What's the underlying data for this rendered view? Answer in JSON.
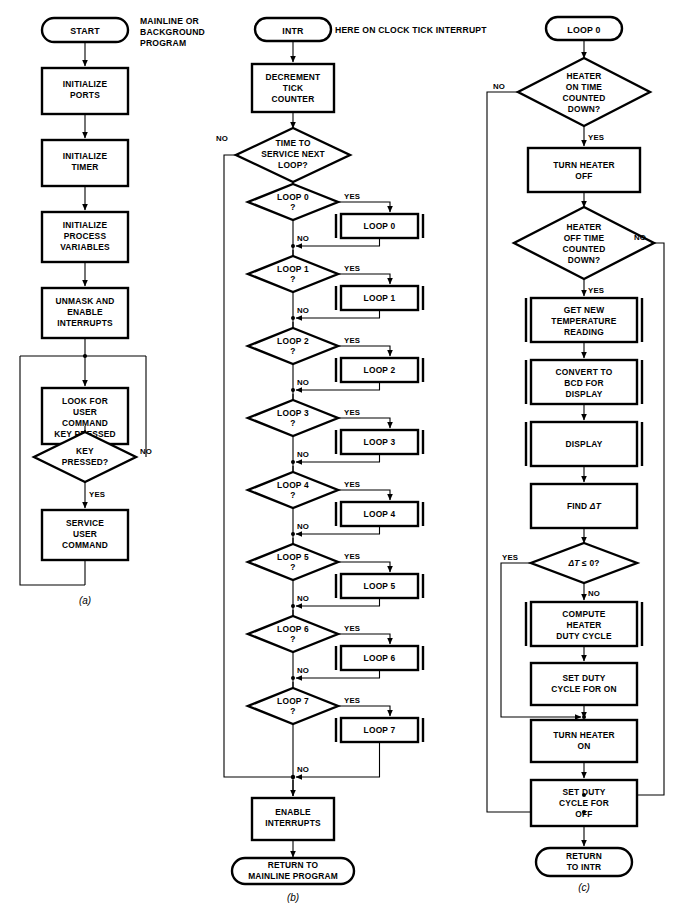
{
  "figure": {
    "type": "flowchart",
    "panels": [
      {
        "id": "a",
        "caption": "(a)",
        "note": "MAINLINE OR BACKGROUND PROGRAM",
        "start": "START",
        "nodes": [
          {
            "kind": "terminal",
            "label": "START"
          },
          {
            "kind": "process",
            "label": "INITIALIZE PORTS"
          },
          {
            "kind": "process",
            "label": "INITIALIZE TIMER"
          },
          {
            "kind": "process",
            "label": "INITIALIZE PROCESS VARIABLES"
          },
          {
            "kind": "process",
            "label": "UNMASK AND ENABLE INTERRUPTS"
          },
          {
            "kind": "process",
            "label": "LOOK FOR USER COMMAND KEY PRESSED"
          },
          {
            "kind": "decision",
            "label": "KEY PRESSED?",
            "yes": "YES",
            "no": "NO"
          },
          {
            "kind": "process",
            "label": "SERVICE USER COMMAND"
          }
        ]
      },
      {
        "id": "b",
        "caption": "(b)",
        "note": "HERE ON CLOCK TICK INTERRUPT",
        "start": "INTR",
        "nodes": [
          {
            "kind": "terminal",
            "label": "INTR"
          },
          {
            "kind": "process",
            "label": "DECREMENT TICK COUNTER"
          },
          {
            "kind": "decision",
            "label": "TIME TO SERVICE NEXT LOOP?",
            "yes": "YES",
            "no": "NO"
          },
          {
            "kind": "decision",
            "label": "LOOP 0 ?",
            "yes": "YES",
            "no": "NO"
          },
          {
            "kind": "subroutine",
            "label": "LOOP 0"
          },
          {
            "kind": "decision",
            "label": "LOOP 1 ?",
            "yes": "YES",
            "no": "NO"
          },
          {
            "kind": "subroutine",
            "label": "LOOP 1"
          },
          {
            "kind": "decision",
            "label": "LOOP 2 ?",
            "yes": "YES",
            "no": "NO"
          },
          {
            "kind": "subroutine",
            "label": "LOOP 2"
          },
          {
            "kind": "decision",
            "label": "LOOP 3 ?",
            "yes": "YES",
            "no": "NO"
          },
          {
            "kind": "subroutine",
            "label": "LOOP 3"
          },
          {
            "kind": "decision",
            "label": "LOOP 4 ?",
            "yes": "YES",
            "no": "NO"
          },
          {
            "kind": "subroutine",
            "label": "LOOP 4"
          },
          {
            "kind": "decision",
            "label": "LOOP 5 ?",
            "yes": "YES",
            "no": "NO"
          },
          {
            "kind": "subroutine",
            "label": "LOOP 5"
          },
          {
            "kind": "decision",
            "label": "LOOP 6 ?",
            "yes": "YES",
            "no": "NO"
          },
          {
            "kind": "subroutine",
            "label": "LOOP 6"
          },
          {
            "kind": "decision",
            "label": "LOOP 7 ?",
            "yes": "YES",
            "no": "NO"
          },
          {
            "kind": "subroutine",
            "label": "LOOP 7"
          },
          {
            "kind": "process",
            "label": "ENABLE INTERRUPTS"
          },
          {
            "kind": "terminal",
            "label": "RETURN TO MAINLINE PROGRAM"
          }
        ]
      },
      {
        "id": "c",
        "caption": "(c)",
        "start": "LOOP 0",
        "nodes": [
          {
            "kind": "terminal",
            "label": "LOOP 0"
          },
          {
            "kind": "decision",
            "label": "HEATER ON TIME COUNTED DOWN?",
            "yes": "YES",
            "no": "NO"
          },
          {
            "kind": "process",
            "label": "TURN HEATER OFF"
          },
          {
            "kind": "decision",
            "label": "HEATER OFF TIME COUNTED DOWN?",
            "yes": "YES",
            "no": "NO"
          },
          {
            "kind": "subroutine",
            "label": "GET NEW TEMPERATURE READING"
          },
          {
            "kind": "subroutine",
            "label": "CONVERT TO BCD FOR DISPLAY"
          },
          {
            "kind": "subroutine",
            "label": "DISPLAY"
          },
          {
            "kind": "process",
            "label": "FIND ΔT"
          },
          {
            "kind": "decision",
            "label": "ΔT ≤ 0?",
            "yes": "YES",
            "no": "NO"
          },
          {
            "kind": "subroutine",
            "label": "COMPUTE HEATER DUTY CYCLE"
          },
          {
            "kind": "process",
            "label": "SET DUTY CYCLE FOR ON"
          },
          {
            "kind": "process",
            "label": "TURN HEATER ON"
          },
          {
            "kind": "process",
            "label": "SET DUTY CYCLE FOR OFF"
          },
          {
            "kind": "terminal",
            "label": "RETURN TO INTR"
          }
        ]
      }
    ]
  },
  "a": {
    "note_l1": "MAINLINE OR",
    "note_l2": "BACKGROUND",
    "note_l3": "PROGRAM",
    "start": "START",
    "init_ports_l1": "INITIALIZE",
    "init_ports_l2": "PORTS",
    "init_timer_l1": "INITIALIZE",
    "init_timer_l2": "TIMER",
    "init_proc_l1": "INITIALIZE",
    "init_proc_l2": "PROCESS",
    "init_proc_l3": "VARIABLES",
    "unmask_l1": "UNMASK AND",
    "unmask_l2": "ENABLE",
    "unmask_l3": "INTERRUPTS",
    "look_l1": "LOOK FOR",
    "look_l2": "USER",
    "look_l3": "COMMAND",
    "look_l4": "KEY PRESSED",
    "key_l1": "KEY",
    "key_l2": "PRESSED?",
    "key_no": "NO",
    "key_yes": "YES",
    "service_l1": "SERVICE",
    "service_l2": "USER",
    "service_l3": "COMMAND",
    "caption": "(a)"
  },
  "b": {
    "note": "HERE ON CLOCK TICK INTERRUPT",
    "start": "INTR",
    "dec_l1": "DECREMENT",
    "dec_l2": "TICK",
    "dec_l3": "COUNTER",
    "time_l1": "TIME TO",
    "time_l2": "SERVICE NEXT",
    "time_l3": "LOOP?",
    "time_no": "NO",
    "time_yes": "YES",
    "loops": [
      {
        "q1": "LOOP 0",
        "q2": "?",
        "yes": "YES",
        "no": "NO",
        "sub": "LOOP 0"
      },
      {
        "q1": "LOOP 1",
        "q2": "?",
        "yes": "YES",
        "no": "NO",
        "sub": "LOOP 1"
      },
      {
        "q1": "LOOP 2",
        "q2": "?",
        "yes": "YES",
        "no": "NO",
        "sub": "LOOP 2"
      },
      {
        "q1": "LOOP 3",
        "q2": "?",
        "yes": "YES",
        "no": "NO",
        "sub": "LOOP 3"
      },
      {
        "q1": "LOOP 4",
        "q2": "?",
        "yes": "YES",
        "no": "NO",
        "sub": "LOOP 4"
      },
      {
        "q1": "LOOP 5",
        "q2": "?",
        "yes": "YES",
        "no": "NO",
        "sub": "LOOP 5"
      },
      {
        "q1": "LOOP 6",
        "q2": "?",
        "yes": "YES",
        "no": "NO",
        "sub": "LOOP 6"
      },
      {
        "q1": "LOOP 7",
        "q2": "?",
        "yes": "YES",
        "no": "NO",
        "sub": "LOOP 7"
      }
    ],
    "enable_l1": "ENABLE",
    "enable_l2": "INTERRUPTS",
    "return_l1": "RETURN TO",
    "return_l2": "MAINLINE PROGRAM",
    "caption": "(b)"
  },
  "c": {
    "start": "LOOP 0",
    "on_l1": "HEATER",
    "on_l2": "ON TIME",
    "on_l3": "COUNTED",
    "on_l4": "DOWN?",
    "on_no": "NO",
    "on_yes": "YES",
    "turn_off_l1": "TURN HEATER",
    "turn_off_l2": "OFF",
    "off_l1": "HEATER",
    "off_l2": "OFF TIME",
    "off_l3": "COUNTED",
    "off_l4": "DOWN?",
    "off_no": "NO",
    "off_yes": "YES",
    "get_l1": "GET NEW",
    "get_l2": "TEMPERATURE",
    "get_l3": "READING",
    "conv_l1": "CONVERT TO",
    "conv_l2": "BCD FOR",
    "conv_l3": "DISPLAY",
    "display": "DISPLAY",
    "find_pre": "FIND ",
    "find_delta": "ΔT",
    "dt_pre": "ΔT",
    "dt_post": " ≤ 0?",
    "dt_yes": "YES",
    "dt_no": "NO",
    "compute_l1": "COMPUTE",
    "compute_l2": "HEATER",
    "compute_l3": "DUTY CYCLE",
    "seton_l1": "SET DUTY",
    "seton_l2": "CYCLE FOR ON",
    "turn_on_l1": "TURN HEATER",
    "turn_on_l2": "ON",
    "setoff_l1": "SET DUTY",
    "setoff_l2": "CYCLE FOR",
    "setoff_l3": "OFF",
    "return_l1": "RETURN",
    "return_l2": "TO INTR",
    "caption": "(c)"
  },
  "colors": {
    "ink": "#000000",
    "paper": "#ffffff"
  }
}
